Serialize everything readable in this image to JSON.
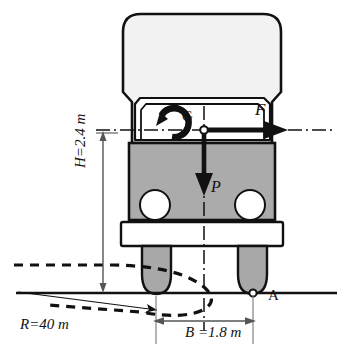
{
  "diagram": {
    "labels": {
      "force_F": "F",
      "center_of_gravity": "G",
      "weight_P": "P",
      "contact_point_A": "A",
      "height_H": "H=2.4 m",
      "radius_R": "R=40  m",
      "track_B": "B =1.8 m"
    },
    "icons": {
      "moment_arrow": "circular-moment-arrow",
      "force_arrow": "right-arrow",
      "weight_arrow": "down-arrow"
    },
    "values": {
      "H_value": 2.4,
      "H_unit": "m",
      "B_value": 1.8,
      "B_unit": "m",
      "R_value": 40,
      "R_unit": "m"
    },
    "colors": {
      "upper_body": "#f2f2f2",
      "lower_body": "#ababab",
      "tire": "#a8a8a8",
      "outline": "#111111",
      "background": "#ffffff"
    }
  }
}
